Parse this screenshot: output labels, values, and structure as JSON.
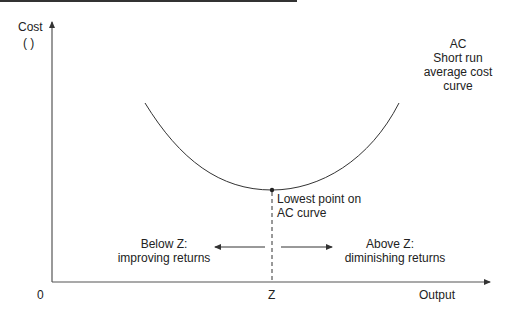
{
  "diagram": {
    "y_axis": {
      "label_line1": "Cost",
      "label_line2": "( )"
    },
    "x_axis": {
      "label": "Output",
      "origin": "0",
      "mark": "Z"
    },
    "curve": {
      "name": "AC",
      "description_lines": [
        "Short run",
        "average cost",
        "curve"
      ]
    },
    "minimum_point": {
      "label_line1": "Lowest point on",
      "label_line2": "AC curve"
    },
    "left_region": {
      "line1": "Below Z:",
      "line2": "improving returns"
    },
    "right_region": {
      "line1": "Above Z:",
      "line2": "diminishing returns"
    },
    "colors": {
      "line": "#333333",
      "text": "#222222"
    }
  }
}
